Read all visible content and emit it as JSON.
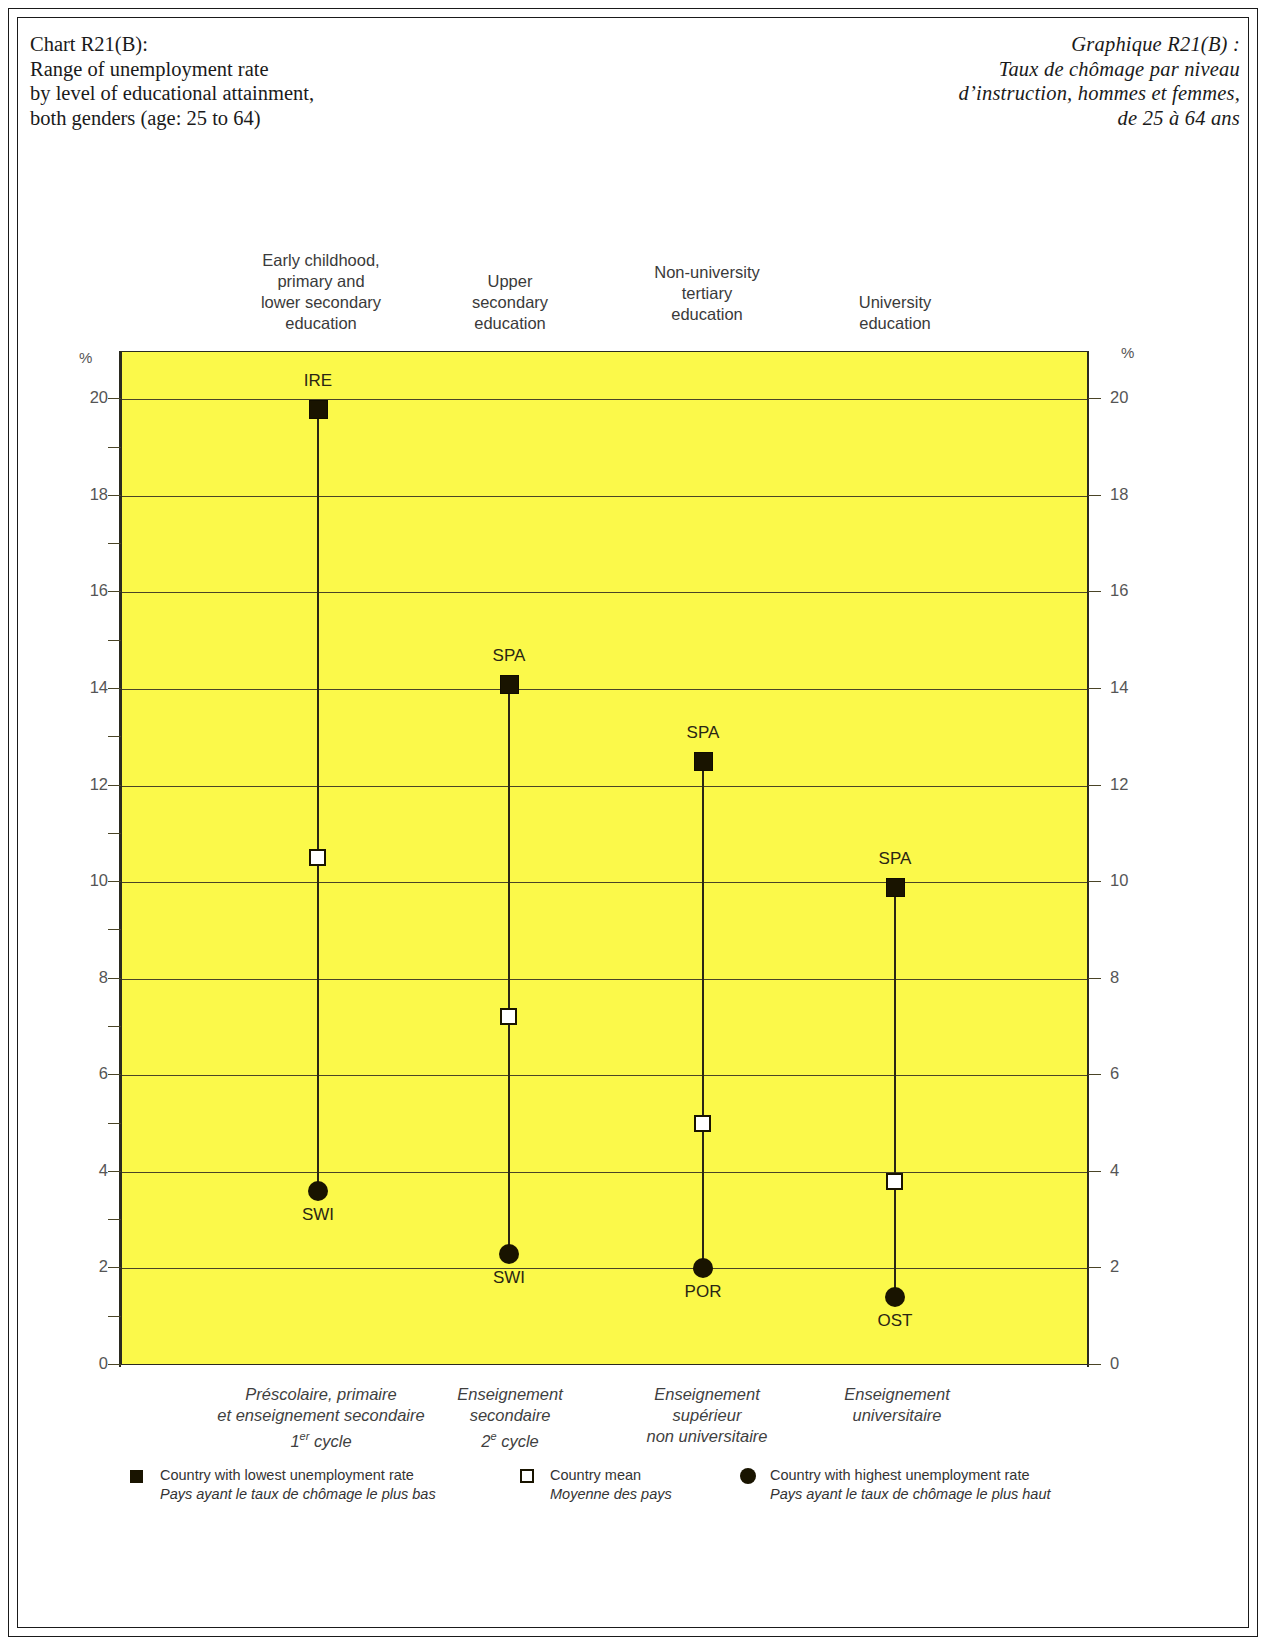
{
  "titles": {
    "en": [
      "Chart R21(B):",
      "Range of unemployment rate",
      "by level of educational attainment,",
      "both genders (age: 25 to 64)"
    ],
    "fr": [
      "Graphique R21(B) :",
      "Taux de chômage  par niveau",
      "d’instruction, hommes et femmes,",
      "de 25 à 64 ans"
    ]
  },
  "axis": {
    "unit_left": "%",
    "unit_right": "%",
    "labels": [
      "20",
      "18",
      "16",
      "14",
      "12",
      "10",
      "8",
      "6",
      "4",
      "2",
      "0"
    ]
  },
  "columns": [
    {
      "header_en": [
        "Early childhood,",
        "primary and",
        "lower secondary",
        "education"
      ],
      "header_fr": [
        "Préscolaire, primaire",
        "et enseignement secondaire",
        "1er cycle"
      ],
      "low_label": "IRE",
      "high_label": "SWI"
    },
    {
      "header_en": [
        "Upper",
        "secondary",
        "education"
      ],
      "header_fr": [
        "Enseignement",
        "secondaire",
        "2e cycle"
      ],
      "low_label": "SPA",
      "high_label": "SWI"
    },
    {
      "header_en": [
        "Non-university",
        "tertiary",
        "education"
      ],
      "header_fr": [
        "Enseignement",
        "supérieur",
        "non universitaire"
      ],
      "low_label": "SPA",
      "high_label": "POR"
    },
    {
      "header_en": [
        "University",
        "education"
      ],
      "header_fr": [
        "Enseignement",
        "universitaire"
      ],
      "low_label": "SPA",
      "high_label": "OST"
    }
  ],
  "legend": [
    {
      "marker": "filled-square",
      "en": "Country with lowest unemployment rate",
      "fr": "Pays ayant le taux de chômage le plus bas"
    },
    {
      "marker": "open-square",
      "en": "Country mean",
      "fr": "Moyenne des pays"
    },
    {
      "marker": "filled-circle",
      "en": "Country with highest unemployment rate",
      "fr": "Pays ayant le taux de chômage le plus haut"
    }
  ],
  "chart_data": {
    "type": "scatter",
    "title": "Range of unemployment rate by level of educational attainment, both genders (age: 25 to 64)",
    "title_fr": "Taux de chômage par niveau d’instruction, hommes et femmes, de 25 à 64 ans",
    "xlabel": "",
    "ylabel": "%",
    "ylim": [
      0,
      21
    ],
    "yticks": [
      0,
      2,
      4,
      6,
      8,
      10,
      12,
      14,
      16,
      18,
      20
    ],
    "minor_tick_step": 1,
    "grid": true,
    "legend_position": "bottom",
    "categories": [
      "Early childhood, primary and lower secondary education",
      "Upper secondary education",
      "Non-university tertiary education",
      "University education"
    ],
    "series": [
      {
        "name": "Country with lowest unemployment rate",
        "marker": "filled-square",
        "values": [
          19.8,
          14.1,
          12.5,
          9.9
        ],
        "point_labels": [
          "IRE",
          "SPA",
          "SPA",
          "SPA"
        ]
      },
      {
        "name": "Country mean",
        "marker": "open-square",
        "values": [
          10.5,
          7.2,
          5.0,
          3.8
        ],
        "point_labels": [
          "",
          "",
          "",
          ""
        ]
      },
      {
        "name": "Country with highest unemployment rate",
        "marker": "filled-circle",
        "values": [
          3.6,
          2.3,
          2.0,
          1.4
        ],
        "point_labels": [
          "SWI",
          "SWI",
          "POR",
          "OST"
        ]
      }
    ]
  }
}
